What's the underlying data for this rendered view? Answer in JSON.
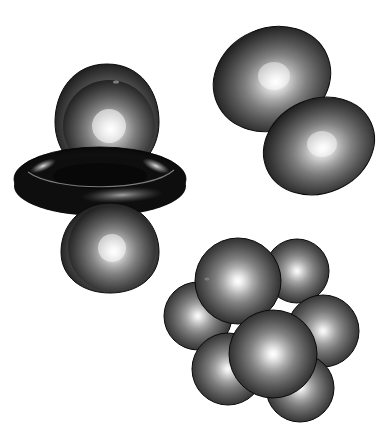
{
  "canvas": {
    "width": 392,
    "height": 431,
    "background_color": "#ffffff",
    "title": "Atomic orbital lobe renderings"
  },
  "palette": {
    "highlight_color": "#ffffff",
    "sphere_mid_color": "#8d8d8d",
    "sphere_body_color": "#555555",
    "sphere_edge_color": "#171717",
    "sphere_rim_color": "#0b0b0b",
    "torus_body_color": "#161616",
    "torus_dark_color": "#000000",
    "torus_highlight_color": "#b9b9b9",
    "outline_color": "#000000"
  },
  "objects": [
    {
      "id": "dz2-orbital",
      "name": "dz2-orbital-group",
      "label": "dz2 orbital with toroidal node",
      "parts": [
        {
          "name": "dz2-top-lobe",
          "shape": "teardrop-lobe",
          "cx": 107,
          "cy": 120,
          "rx": 51,
          "ry": 56,
          "highlight_x": 109,
          "highlight_y": 124
        },
        {
          "name": "dz2-torus",
          "shape": "torus",
          "cx": 100,
          "cy": 179,
          "rx": 86,
          "ry": 32,
          "tube_ry": 15
        },
        {
          "name": "dz2-bottom-lobe",
          "shape": "teardrop-lobe",
          "cx": 110,
          "cy": 252,
          "rx": 48,
          "ry": 39,
          "highlight_x": 112,
          "highlight_y": 244
        }
      ]
    },
    {
      "id": "p-orbital",
      "name": "p-orbital-group",
      "label": "p orbital lobe pair",
      "parts": [
        {
          "name": "p-upper-lobe",
          "shape": "ellipsoid",
          "cx": 272,
          "cy": 79,
          "rx": 60,
          "ry": 51,
          "rotation": -24,
          "highlight_x": 274,
          "highlight_y": 75
        },
        {
          "name": "p-lower-lobe",
          "shape": "ellipsoid",
          "cx": 319,
          "cy": 146,
          "rx": 57,
          "ry": 47,
          "rotation": -24,
          "highlight_x": 322,
          "highlight_y": 143
        }
      ]
    },
    {
      "id": "sphere-cluster",
      "name": "sphere-cluster-group",
      "label": "seven sphere close-packed cluster",
      "parts": [
        {
          "name": "cluster-sphere-back-right",
          "shape": "sphere",
          "cx": 297,
          "cy": 271,
          "r": 32,
          "highlight_x": 293,
          "highlight_y": 268
        },
        {
          "name": "cluster-sphere-back-left",
          "shape": "sphere",
          "cx": 238,
          "cy": 281,
          "r": 43,
          "highlight_x": 236,
          "highlight_y": 280
        },
        {
          "name": "cluster-sphere-left",
          "shape": "sphere",
          "cx": 198,
          "cy": 316,
          "r": 34,
          "highlight_x": 198,
          "highlight_y": 315
        },
        {
          "name": "cluster-sphere-right",
          "shape": "sphere",
          "cx": 323,
          "cy": 331,
          "r": 36,
          "highlight_x": 320,
          "highlight_y": 330
        },
        {
          "name": "cluster-sphere-bottom-left",
          "shape": "sphere",
          "cx": 228,
          "cy": 369,
          "r": 36,
          "highlight_x": 226,
          "highlight_y": 365
        },
        {
          "name": "cluster-sphere-bottom-right",
          "shape": "sphere",
          "cx": 300,
          "cy": 388,
          "r": 34,
          "highlight_x": 300,
          "highlight_y": 386
        },
        {
          "name": "cluster-sphere-front",
          "shape": "sphere",
          "cx": 273,
          "cy": 354,
          "r": 44,
          "highlight_x": 272,
          "highlight_y": 352
        }
      ]
    }
  ]
}
